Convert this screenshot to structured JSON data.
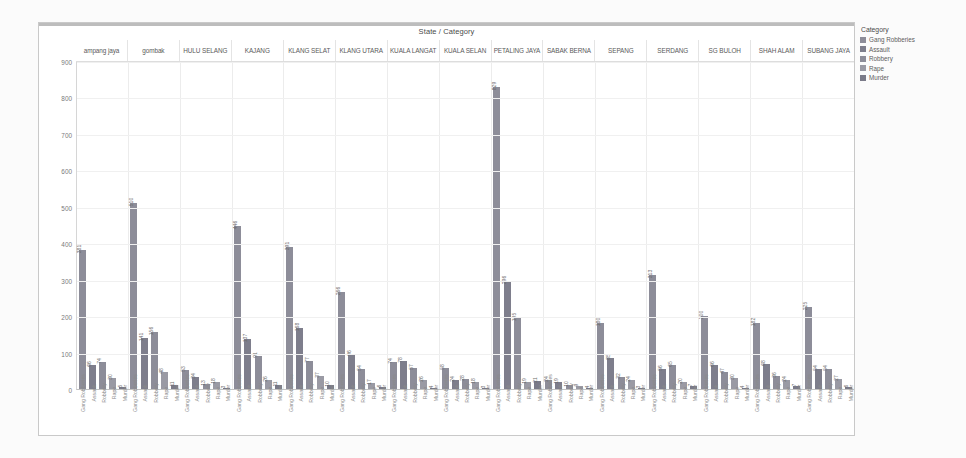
{
  "chart_title": "State / Category",
  "legend": {
    "title": "Category",
    "items": [
      {
        "label": "Gang Robberies",
        "color": "#8d8d99"
      },
      {
        "label": "Assault",
        "color": "#7e7e8c"
      },
      {
        "label": "Robbery",
        "color": "#8d8d99"
      },
      {
        "label": "Rape",
        "color": "#9a9aa4"
      },
      {
        "label": "Murder",
        "color": "#7a7a88"
      }
    ]
  },
  "chart_data": {
    "type": "bar",
    "title": "State / Category",
    "xlabel": "",
    "ylabel": "",
    "ylim": [
      0,
      900
    ],
    "yticks": [
      0,
      100,
      200,
      300,
      400,
      500,
      600,
      700,
      800,
      900
    ],
    "grid": true,
    "legend_position": "right",
    "categories": [
      "ampang jaya",
      "gombak",
      "HULU SELANG",
      "KAJANG",
      "KLANG SELAT",
      "KLANG UTARA",
      "KUALA LANGAT",
      "KUALA SELAN",
      "PETALING JAYA",
      "SABAK BERNA",
      "SEPANG",
      "SERDANG",
      "SG  BULOH",
      "SHAH ALAM",
      "SUBANG JAYA"
    ],
    "sub_categories": [
      "Gang Robberies",
      "Assault",
      "Robbery",
      "Rape",
      "Murder"
    ],
    "series": [
      {
        "name": "Gang Robberies",
        "values": [
          381,
          510,
          53,
          446,
          391,
          266,
          74,
          58,
          829,
          24,
          180,
          313,
          200,
          182,
          225
        ]
      },
      {
        "name": "Assault",
        "values": [
          66,
          141,
          34,
          137,
          168,
          96,
          78,
          24,
          296,
          19,
          85,
          56,
          66,
          68,
          54
        ]
      },
      {
        "name": "Robbery",
        "values": [
          74,
          156,
          13,
          91,
          77,
          54,
          57,
          28,
          195,
          10,
          32,
          65,
          47,
          36,
          54
        ]
      },
      {
        "name": "Rape",
        "values": [
          30,
          48,
          18,
          26,
          37,
          17,
          26,
          18,
          19,
          9,
          24,
          20,
          30,
          24,
          27
        ]
      },
      {
        "name": "Murder",
        "values": [
          5,
          11,
          3,
          11,
          10,
          6,
          4,
          3,
          21,
          4,
          3,
          7,
          4,
          7,
          6
        ]
      }
    ],
    "values_flat": [
      381,
      66,
      74,
      30,
      5,
      510,
      141,
      156,
      48,
      11,
      53,
      34,
      13,
      18,
      3,
      446,
      137,
      91,
      26,
      11,
      391,
      168,
      77,
      37,
      10,
      266,
      96,
      54,
      17,
      6,
      74,
      78,
      57,
      26,
      4,
      58,
      24,
      28,
      18,
      3,
      829,
      296,
      195,
      19,
      21,
      24,
      19,
      10,
      9,
      4,
      180,
      85,
      32,
      24,
      3,
      313,
      56,
      65,
      20,
      7,
      200,
      66,
      47,
      30,
      4,
      182,
      68,
      36,
      24,
      7,
      225,
      54,
      54,
      27,
      6
    ]
  }
}
